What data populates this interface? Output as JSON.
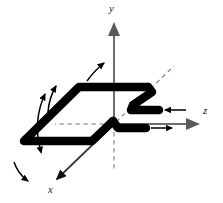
{
  "figure": {
    "type": "technical-diagram",
    "background_color": "#ffffff",
    "width": 223,
    "height": 203
  },
  "axes": {
    "color": "#6e6e6e",
    "dash_color": "#7a7a7a",
    "origin": {
      "x": 114,
      "y": 124
    },
    "items": [
      {
        "name": "y-axis",
        "label": "y",
        "direction": "up",
        "solid_from": {
          "x": 114,
          "y": 124
        },
        "solid_to": {
          "x": 114,
          "y": 22
        },
        "dashed_from": {
          "x": 114,
          "y": 124
        },
        "dashed_to": {
          "x": 114,
          "y": 168
        },
        "arrowhead": true
      },
      {
        "name": "z-axis",
        "label": "z",
        "direction": "right",
        "solid_from": {
          "x": 114,
          "y": 124
        },
        "solid_to": {
          "x": 200,
          "y": 124
        },
        "dashed_from": {
          "x": 114,
          "y": 124
        },
        "dashed_to": {
          "x": 57,
          "y": 124
        },
        "arrowhead": true
      },
      {
        "name": "x-axis",
        "label": "x",
        "direction": "down-left",
        "solid_from": {
          "x": 114,
          "y": 124
        },
        "solid_to": {
          "x": 55,
          "y": 181
        },
        "dashed_from": {
          "x": 114,
          "y": 124
        },
        "dashed_to": {
          "x": 172,
          "y": 68
        },
        "arrowhead": true
      }
    ]
  },
  "wire_loop": {
    "name": "conducting-wire-loop",
    "color": "#000000",
    "stroke_width": 8,
    "shape": "parallelogram-with-z-bend-leads",
    "corners": {
      "top_left": {
        "x": 72,
        "y": 87
      },
      "top_right": {
        "x": 148,
        "y": 87
      },
      "bottom_right": {
        "x": 100,
        "y": 155
      },
      "bottom_left": {
        "x": 22,
        "y": 155
      }
    }
  },
  "leads": [
    {
      "name": "upper-lead",
      "from": {
        "x": 148,
        "y": 87
      },
      "bend": {
        "x": 132,
        "y": 104
      },
      "end": {
        "x": 158,
        "y": 116
      },
      "arrow": {
        "name": "upper-lead-arrow",
        "direction": "left",
        "from": {
          "x": 185,
          "y": 116
        },
        "to": {
          "x": 163,
          "y": 116
        }
      }
    },
    {
      "name": "lower-lead",
      "from": {
        "x": 100,
        "y": 155
      },
      "bend": {
        "x": 118,
        "y": 133
      },
      "end": {
        "x": 146,
        "y": 133
      },
      "arrow": {
        "name": "lower-lead-arrow",
        "direction": "right",
        "from": {
          "x": 150,
          "y": 133
        },
        "to": {
          "x": 172,
          "y": 133
        }
      }
    }
  ],
  "motion_arrows": [
    {
      "name": "top-curved-arrow",
      "style": "single-headed",
      "path": "M 101 62 Q 92 70 85 82",
      "head_at": "start",
      "head_angle": -55
    },
    {
      "name": "upper-left-curved-arrow",
      "style": "single-headed",
      "path": "M 50 90 Q 47 102 50 116",
      "head_at": "start",
      "head_angle": -20
    },
    {
      "name": "left-edge-curved-arrow",
      "style": "double-headed",
      "path": "M 50 90 Q 38 118 43 150",
      "head_at": "both"
    },
    {
      "name": "bottom-left-curved-arrow",
      "style": "single-headed",
      "path": "M 16 163 Q 20 174 30 180",
      "head_at": "end",
      "head_angle": 35
    }
  ]
}
